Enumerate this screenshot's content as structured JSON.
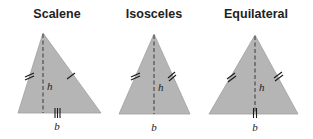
{
  "diagram": {
    "triangles": [
      {
        "id": "scalene",
        "title": "Scalene",
        "height_label": "h",
        "base_label": "b",
        "fill_color": "#b5b5b5",
        "tick_marks": {
          "left_side": 2,
          "right_side": 1,
          "base": 3
        }
      },
      {
        "id": "isosceles",
        "title": "Isosceles",
        "height_label": "h",
        "base_label": "b",
        "fill_color": "#b5b5b5",
        "tick_marks": {
          "left_side": 2,
          "right_side": 2,
          "base": 0
        }
      },
      {
        "id": "equilateral",
        "title": "Equilateral",
        "height_label": "h",
        "base_label": "b",
        "fill_color": "#b5b5b5",
        "tick_marks": {
          "left_side": 2,
          "right_side": 2,
          "base": 2
        }
      }
    ]
  }
}
